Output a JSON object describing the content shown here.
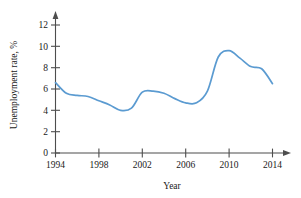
{
  "chart_data": {
    "type": "line",
    "title": "",
    "xlabel": "Year",
    "ylabel": "Unemployment rate, %",
    "xlim": [
      1994,
      2015
    ],
    "ylim": [
      0,
      13
    ],
    "grid": false,
    "legend": false,
    "line_color": "#5b9bd1",
    "axis_color": "#4d4d4d",
    "xticks": [
      1994,
      1998,
      2002,
      2006,
      2010,
      2014
    ],
    "xtick_labels": [
      "1994",
      "1998",
      "2002",
      "2006",
      "2010",
      "2014"
    ],
    "yticks": [
      0,
      2,
      4,
      6,
      8,
      10,
      12
    ],
    "ytick_labels": [
      "0",
      "2",
      "4",
      "6",
      "8",
      "10",
      "12"
    ],
    "x": [
      1994,
      1995,
      1996,
      1997,
      1998,
      1999,
      2000,
      2001,
      2002,
      2003,
      2004,
      2005,
      2006,
      2007,
      2008,
      2009,
      2010,
      2011,
      2012,
      2013,
      2014
    ],
    "values": [
      6.6,
      5.6,
      5.4,
      5.3,
      4.9,
      4.5,
      4.0,
      4.2,
      5.7,
      5.8,
      5.6,
      5.1,
      4.7,
      4.7,
      5.8,
      9.0,
      9.6,
      8.9,
      8.1,
      7.9,
      6.5
    ],
    "series": [
      {
        "name": "Unemployment rate",
        "values": [
          6.6,
          5.6,
          5.4,
          5.3,
          4.9,
          4.5,
          4.0,
          4.2,
          5.7,
          5.8,
          5.6,
          5.1,
          4.7,
          4.7,
          5.8,
          9.0,
          9.6,
          8.9,
          8.1,
          7.9,
          6.5
        ]
      }
    ],
    "annotations": []
  }
}
